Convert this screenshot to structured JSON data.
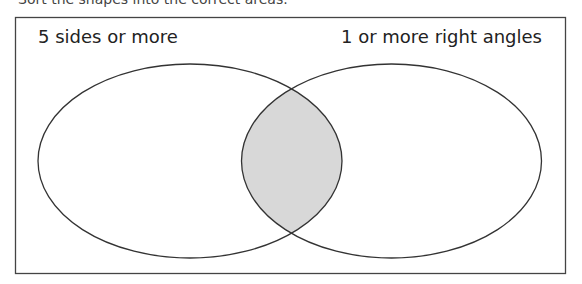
{
  "diagram": {
    "type": "venn",
    "cutoff_text": "Sort the shapes into the correct areas.",
    "sets": [
      {
        "label": "5 sides or more"
      },
      {
        "label": "1 or more right angles"
      }
    ],
    "intersection_fill": "#d8d8d8",
    "stroke_color": "#333333"
  }
}
